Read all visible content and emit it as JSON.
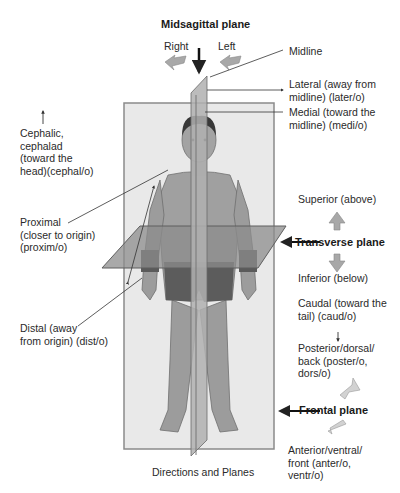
{
  "title": "Midsagittal plane",
  "caption": "Directions and Planes",
  "direction_arrows": {
    "right": "Right",
    "left": "Left"
  },
  "labels": {
    "midline": "Midline",
    "lateral": "Lateral (away from\nmidline) (later/o)",
    "medial": "Medial (toward the\nmidline) (medi/o)",
    "cephalic": "Cephalic,\ncephalad\n(toward the\nhead)(cephal/o)",
    "proximal": "Proximal\n(closer to origin)\n(proxim/o)",
    "distal": "Distal (away\nfrom origin) (dist/o)",
    "superior": "Superior (above)",
    "transverse_plane": "Transverse plane",
    "inferior": "Inferior (below)",
    "caudal": "Caudal (toward the\ntail) (caud/o)",
    "posterior": "Posterior/dorsal/\nback (poster/o,\ndors/o)",
    "frontal_plane": "Frontal plane",
    "anterior": "Anterior/ventral/\nfront (anter/o,\nventr/o)"
  },
  "colors": {
    "frontal_plane_fill": "#e8e8e8",
    "frontal_plane_edge": "#8a8a8a",
    "sagittal_plane_fill": "#a9a9a9",
    "transverse_plane_fill": "#8f8f8f",
    "skin": "#9a9a9a",
    "hair": "#3a3a3a",
    "arrow_gray": "#a8a8a8",
    "text": "#2a2a2a"
  }
}
